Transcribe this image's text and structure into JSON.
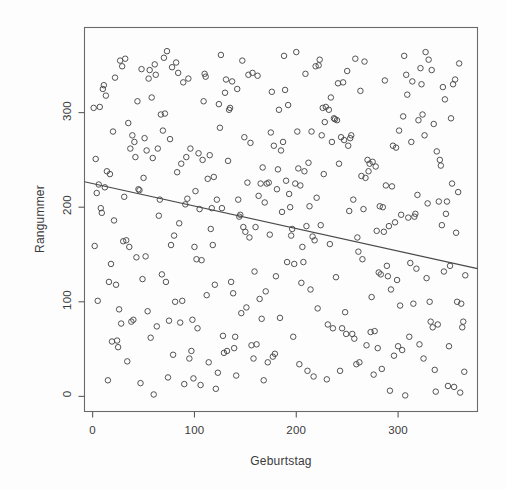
{
  "chart_data": {
    "type": "scatter",
    "title": "",
    "xlabel": "Geburtstag",
    "ylabel": "Rangummer",
    "xlim": [
      -8,
      378
    ],
    "ylim": [
      -16,
      390
    ],
    "xticks": [
      0,
      100,
      200,
      300
    ],
    "xticklabels": [
      "0",
      "100",
      "200",
      "300"
    ],
    "yticks": [
      0,
      100,
      200,
      300
    ],
    "yticklabels": [
      "0",
      "100",
      "200",
      "300"
    ],
    "grid": false,
    "legend": null,
    "marker": "open-circle",
    "marker_color": "#4a4a4a",
    "marker_size": 5.5,
    "frame_color": "#5a5a5a",
    "trendline": {
      "type": "linear-fit",
      "color": "#4a4a4a",
      "x_start": 0,
      "y_start": 225,
      "x_end": 366,
      "y_end": 138,
      "slope": -0.2377,
      "intercept": 225.0
    },
    "n_points": 366,
    "x": [
      1,
      2,
      3,
      4,
      5,
      6,
      7,
      8,
      9,
      10,
      11,
      12,
      13,
      14,
      15,
      16,
      17,
      18,
      19,
      20,
      21,
      22,
      23,
      24,
      25,
      26,
      27,
      28,
      29,
      30,
      31,
      32,
      33,
      34,
      35,
      36,
      37,
      38,
      39,
      40,
      41,
      42,
      43,
      44,
      45,
      46,
      47,
      48,
      49,
      50,
      51,
      52,
      53,
      54,
      55,
      56,
      57,
      58,
      59,
      60,
      61,
      62,
      63,
      64,
      65,
      66,
      67,
      68,
      69,
      70,
      71,
      72,
      73,
      74,
      75,
      76,
      77,
      78,
      79,
      80,
      81,
      82,
      83,
      84,
      85,
      86,
      87,
      88,
      89,
      90,
      91,
      92,
      93,
      94,
      95,
      96,
      97,
      98,
      99,
      100,
      101,
      102,
      103,
      104,
      105,
      106,
      107,
      108,
      109,
      110,
      111,
      112,
      113,
      114,
      115,
      116,
      117,
      118,
      119,
      120,
      121,
      122,
      123,
      124,
      125,
      126,
      127,
      128,
      129,
      130,
      131,
      132,
      133,
      134,
      135,
      136,
      137,
      138,
      139,
      140,
      141,
      142,
      143,
      144,
      145,
      146,
      147,
      148,
      149,
      150,
      151,
      152,
      153,
      154,
      155,
      156,
      157,
      158,
      159,
      160,
      161,
      162,
      163,
      164,
      165,
      166,
      167,
      168,
      169,
      170,
      171,
      172,
      173,
      174,
      175,
      176,
      177,
      178,
      179,
      180,
      181,
      182,
      183,
      184,
      185,
      186,
      187,
      188,
      189,
      190,
      191,
      192,
      193,
      194,
      195,
      196,
      197,
      198,
      199,
      200,
      201,
      202,
      203,
      204,
      205,
      206,
      207,
      208,
      209,
      210,
      211,
      212,
      213,
      214,
      215,
      216,
      217,
      218,
      219,
      220,
      221,
      222,
      223,
      224,
      225,
      226,
      227,
      228,
      229,
      230,
      231,
      232,
      233,
      234,
      235,
      236,
      237,
      238,
      239,
      240,
      241,
      242,
      243,
      244,
      245,
      246,
      247,
      248,
      249,
      250,
      251,
      252,
      253,
      254,
      255,
      256,
      257,
      258,
      259,
      260,
      261,
      262,
      263,
      264,
      265,
      266,
      267,
      268,
      269,
      270,
      271,
      272,
      273,
      274,
      275,
      276,
      277,
      278,
      279,
      280,
      281,
      282,
      283,
      284,
      285,
      286,
      287,
      288,
      289,
      290,
      291,
      292,
      293,
      294,
      295,
      296,
      297,
      298,
      299,
      300,
      301,
      302,
      303,
      304,
      305,
      306,
      307,
      308,
      309,
      310,
      311,
      312,
      313,
      314,
      315,
      316,
      317,
      318,
      319,
      320,
      321,
      322,
      323,
      324,
      325,
      326,
      327,
      328,
      329,
      330,
      331,
      332,
      333,
      334,
      335,
      336,
      337,
      338,
      339,
      340,
      341,
      342,
      343,
      344,
      345,
      346,
      347,
      348,
      349,
      350,
      351,
      352,
      353,
      354,
      355,
      356,
      357,
      358,
      359,
      360,
      361,
      362,
      363,
      364,
      365,
      366
    ],
    "y": [
      305,
      159,
      251,
      215,
      101,
      224,
      306,
      199,
      194,
      325,
      329,
      221,
      318,
      238,
      17,
      121,
      235,
      140,
      58,
      280,
      186,
      337,
      118,
      59,
      52,
      92,
      355,
      77,
      349,
      164,
      211,
      357,
      165,
      37,
      289,
      158,
      262,
      79,
      276,
      81,
      269,
      253,
      147,
      312,
      219,
      218,
      14,
      346,
      124,
      231,
      273,
      148,
      260,
      90,
      336,
      345,
      62,
      316,
      252,
      2,
      351,
      340,
      74,
      262,
      191,
      208,
      298,
      129,
      281,
      358,
      299,
      121,
      365,
      20,
      80,
      272,
      160,
      348,
      44,
      170,
      100,
      353,
      237,
      342,
      183,
      78,
      246,
      101,
      332,
      13,
      203,
      253,
      209,
      336,
      40,
      262,
      48,
      81,
      19,
      158,
      217,
      145,
      72,
      257,
      198,
      12,
      144,
      250,
      312,
      341,
      338,
      107,
      230,
      36,
      255,
      177,
      199,
      160,
      232,
      118,
      8,
      208,
      25,
      309,
      284,
      361,
      199,
      64,
      46,
      321,
      335,
      48,
      249,
      303,
      305,
      121,
      333,
      109,
      51,
      63,
      22,
      325,
      208,
      190,
      192,
      88,
      355,
      179,
      274,
      174,
      94,
      226,
      340,
      168,
      268,
      54,
      342,
      40,
      132,
      179,
      55,
      339,
      212,
      103,
      225,
      82,
      242,
      17,
      205,
      111,
      225,
      36,
      226,
      171,
      279,
      322,
      42,
      265,
      45,
      127,
      219,
      240,
      303,
      83,
      260,
      195,
      269,
      360,
      324,
      228,
      142,
      308,
      214,
      200,
      170,
      177,
      63,
      140,
      225,
      364,
      280,
      241,
      34,
      223,
      120,
      158,
      142,
      238,
      341,
      180,
      27,
      247,
      201,
      113,
      280,
      169,
      21,
      165,
      349,
      210,
      93,
      350,
      356,
      181,
      276,
      305,
      235,
      290,
      306,
      18,
      76,
      303,
      161,
      316,
      269,
      72,
      294,
      293,
      126,
      292,
      331,
      246,
      27,
      274,
      72,
      332,
      271,
      89,
      66,
      344,
      265,
      196,
      273,
      276,
      66,
      208,
      61,
      357,
      34,
      168,
      153,
      36,
      323,
      233,
      145,
      198,
      354,
      231,
      54,
      250,
      238,
      246,
      68,
      105,
      248,
      23,
      69,
      243,
      175,
      51,
      131,
      201,
      129,
      29,
      200,
      174,
      334,
      223,
      138,
      127,
      180,
      6,
      113,
      222,
      265,
      43,
      184,
      263,
      123,
      53,
      281,
      96,
      192,
      49,
      296,
      360,
      1,
      340,
      319,
      189,
      63,
      141,
      269,
      333,
      98,
      190,
      193,
      135,
      213,
      292,
      55,
      347,
      330,
      298,
      40,
      276,
      364,
      125,
      204,
      356,
      100,
      79,
      345,
      73,
      288,
      28,
      5,
      259,
      76,
      206,
      250,
      244,
      181,
      327,
      132,
      314,
      193,
      206,
      11,
      53,
      138,
      294,
      225,
      330,
      10,
      335,
      173,
      100,
      216,
      352,
      4,
      98,
      73,
      79,
      26,
      128,
      252,
      15,
      149,
      347,
      131,
      253,
      146,
      34,
      255,
      227,
      76,
      99,
      25,
      211,
      32,
      240,
      115,
      229,
      169,
      12,
      186,
      122,
      24,
      110,
      228,
      359,
      362,
      92,
      228,
      326,
      168,
      101,
      194,
      150,
      169,
      284,
      24,
      102,
      199,
      261,
      50,
      287,
      137,
      40,
      55,
      152,
      167,
      206,
      44,
      285,
      15
    ],
    "source_note": ""
  },
  "axes": {
    "x_axis_name": "x-axis",
    "y_axis_name": "y-axis"
  }
}
